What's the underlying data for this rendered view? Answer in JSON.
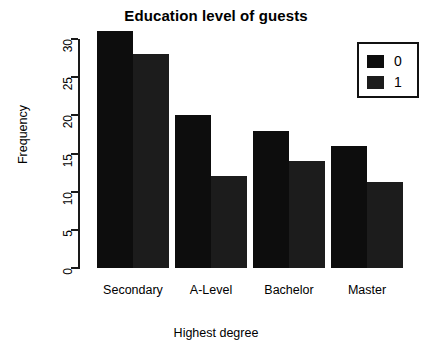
{
  "chart_data": {
    "type": "bar",
    "title": "Education level of guests",
    "xlabel": "Highest degree",
    "ylabel": "Frequency",
    "categories": [
      "Secondary",
      "A-Level",
      "Bachelor",
      "Master"
    ],
    "series": [
      {
        "name": "0",
        "values": [
          31,
          20,
          18,
          16
        ],
        "color": "#0d0d0d"
      },
      {
        "name": "1",
        "values": [
          28,
          12,
          14,
          11.3
        ],
        "color": "#1c1c1c"
      }
    ],
    "ylim": [
      0,
      31
    ],
    "yticks": [
      0,
      5,
      10,
      15,
      20,
      25,
      30
    ],
    "ytick_labels": [
      "0",
      "5",
      "10",
      "15",
      "20",
      "25",
      "30"
    ],
    "grid": false,
    "legend": {
      "position": "top-right",
      "entries": [
        {
          "label": "0",
          "color": "#0d0d0d"
        },
        {
          "label": "1",
          "color": "#1c1c1c"
        }
      ]
    }
  }
}
